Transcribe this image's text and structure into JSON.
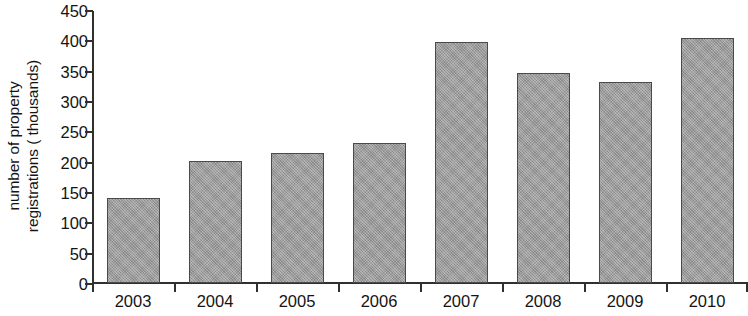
{
  "chart_data": {
    "type": "bar",
    "title": "",
    "subtitle": "",
    "xlabel": "",
    "ylabel": "number of property registrations ( thousands)",
    "ylabel_lines": [
      "number of property",
      "registrations ( thousands)"
    ],
    "categories": [
      "2003",
      "2004",
      "2005",
      "2006",
      "2007",
      "2008",
      "2009",
      "2010"
    ],
    "values": [
      140,
      201,
      214,
      231,
      397,
      346,
      332,
      404
    ],
    "ylim": [
      0,
      450
    ],
    "y_ticks": [
      0,
      50,
      100,
      150,
      200,
      250,
      300,
      350,
      400,
      450
    ],
    "y_tick_labels": [
      "0",
      "50",
      "100",
      "150",
      "200",
      "250",
      "300",
      "350",
      "400",
      "450"
    ],
    "grid": false,
    "legend": false,
    "legend_position": "none",
    "bar_fill_color": "#9d9d9d",
    "bar_border_color": "#4a4a4a",
    "axis_color": "#303030",
    "background_color": "#ffffff"
  }
}
